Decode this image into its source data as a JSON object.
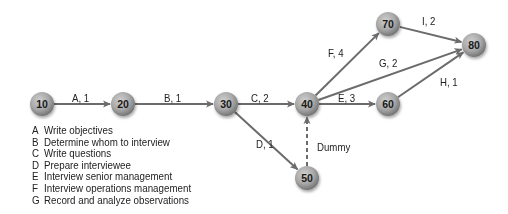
{
  "colors": {
    "arrow": "#6b6b6b",
    "node_center": "#c4c4c4",
    "node_edge": "#7a7a7a",
    "text": "#222222"
  },
  "nodes": [
    {
      "id": "10",
      "x": 42,
      "y": 104
    },
    {
      "id": "20",
      "x": 123,
      "y": 104
    },
    {
      "id": "30",
      "x": 226,
      "y": 104
    },
    {
      "id": "40",
      "x": 307,
      "y": 104
    },
    {
      "id": "50",
      "x": 307,
      "y": 178
    },
    {
      "id": "60",
      "x": 388,
      "y": 104
    },
    {
      "id": "70",
      "x": 388,
      "y": 24
    },
    {
      "id": "80",
      "x": 474,
      "y": 45
    }
  ],
  "edges": [
    {
      "from": "10",
      "to": "20",
      "label": "A, 1",
      "lx": 72,
      "ly": 92
    },
    {
      "from": "20",
      "to": "30",
      "label": "B, 1",
      "lx": 164,
      "ly": 92
    },
    {
      "from": "30",
      "to": "40",
      "label": "C, 2",
      "lx": 251,
      "ly": 92
    },
    {
      "from": "30",
      "to": "50",
      "label": "D, 1",
      "lx": 256,
      "ly": 138
    },
    {
      "from": "50",
      "to": "40",
      "label": "Dummy",
      "lx": 317,
      "ly": 141,
      "dashed": true
    },
    {
      "from": "40",
      "to": "70",
      "label": "F, 4",
      "lx": 328,
      "ly": 47
    },
    {
      "from": "40",
      "to": "80",
      "label": "G, 2",
      "lx": 379,
      "ly": 57
    },
    {
      "from": "40",
      "to": "60",
      "label": "E, 3",
      "lx": 338,
      "ly": 92
    },
    {
      "from": "70",
      "to": "80",
      "label": "I, 2",
      "lx": 422,
      "ly": 15
    },
    {
      "from": "60",
      "to": "80",
      "label": "H, 1",
      "lx": 440,
      "ly": 76
    }
  ],
  "legend": [
    {
      "key": "A",
      "text": "Write objectives"
    },
    {
      "key": "B",
      "text": "Determine whom to interview"
    },
    {
      "key": "C",
      "text": "Write questions"
    },
    {
      "key": "D",
      "text": "Prepare interviewee"
    },
    {
      "key": "E",
      "text": "Interview senior management"
    },
    {
      "key": "F",
      "text": "Interview operations management"
    },
    {
      "key": "G",
      "text": "Record and analyze observations"
    }
  ]
}
